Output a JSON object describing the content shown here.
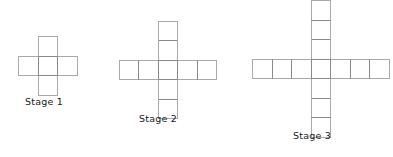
{
  "figure": {
    "background_color": "#ffffff",
    "outline_color": "#a9a9a9",
    "shared_edge_color": "#8a8a8a",
    "cell_fill_color": "#ffffff",
    "cell_size_px": 19.5,
    "label_color": "#1a1a1a"
  },
  "chart_data": {
    "type": "diagram",
    "xlabel": "",
    "ylabel": "",
    "categories": [
      "Stage 1",
      "Stage 2",
      "Stage 3"
    ],
    "values": [
      5,
      9,
      13
    ],
    "series": [
      {
        "name": "Total squares",
        "values": [
          5,
          9,
          13
        ]
      },
      {
        "name": "Arm length",
        "values": [
          1,
          2,
          3
        ]
      },
      {
        "name": "Horizontal squares",
        "values": [
          3,
          5,
          7
        ]
      },
      {
        "name": "Vertical squares",
        "values": [
          3,
          5,
          7
        ]
      }
    ]
  },
  "stages": [
    {
      "id": "stage-1",
      "label": "Stage 1",
      "arm_length": 1,
      "total_squares": 5,
      "horizontal_squares": 3,
      "vertical_squares": 3,
      "center_x": 48,
      "center_y": 66,
      "label_left": 25,
      "label_top": 96
    },
    {
      "id": "stage-2",
      "label": "Stage 2",
      "arm_length": 2,
      "total_squares": 9,
      "horizontal_squares": 5,
      "vertical_squares": 5,
      "center_x": 168,
      "center_y": 70,
      "label_left": 139,
      "label_top": 113
    },
    {
      "id": "stage-3",
      "label": "Stage 3",
      "arm_length": 3,
      "total_squares": 13,
      "horizontal_squares": 7,
      "vertical_squares": 7,
      "center_x": 321,
      "center_y": 69,
      "label_left": 293,
      "label_top": 130
    }
  ]
}
